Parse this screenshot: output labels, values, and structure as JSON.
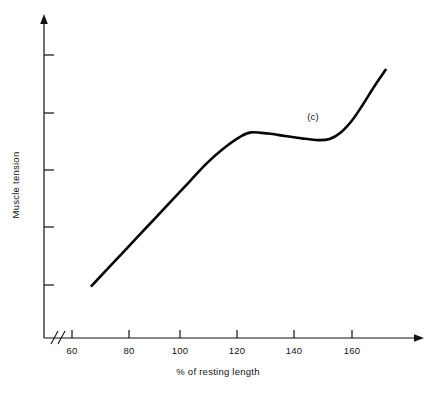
{
  "chart_data": {
    "type": "line",
    "title": "",
    "xlabel": "%  of resting length",
    "ylabel": "Muscle tension",
    "annotations": [
      {
        "text": "(c)",
        "x": 150,
        "y_rel": 0.78
      }
    ],
    "xlim": [
      60,
      172
    ],
    "ylim": [
      0,
      1
    ],
    "grid": false,
    "legend": null,
    "axis_break": "//",
    "xticks": [
      60,
      80,
      100,
      120,
      140,
      160
    ],
    "xtick_labels": [
      "60",
      "80",
      "100",
      "120",
      "140",
      "160"
    ],
    "yticks": [
      0.2,
      0.4,
      0.6,
      0.8,
      1.0
    ],
    "ytick_labels": [
      "",
      "",
      "",
      "",
      ""
    ],
    "series": [
      {
        "name": "muscle tension",
        "x": [
          67,
          72,
          78,
          84,
          90,
          96,
          102,
          108,
          114,
          120,
          124,
          130,
          136,
          142,
          148,
          152,
          156,
          160,
          164,
          168,
          172
        ],
        "y": [
          0.175,
          0.225,
          0.285,
          0.345,
          0.405,
          0.465,
          0.525,
          0.585,
          0.635,
          0.675,
          0.69,
          0.686,
          0.678,
          0.67,
          0.664,
          0.668,
          0.69,
          0.73,
          0.785,
          0.845,
          0.9
        ]
      }
    ]
  },
  "axes": {
    "x_axis_name": "percent-of-resting-length-axis",
    "y_axis_name": "muscle-tension-axis",
    "x_title": "%  of resting length",
    "y_title": "Muscle tension",
    "tick_labels": {
      "t60": "60",
      "t80": "80",
      "t100": "100",
      "t120": "120",
      "t140": "140",
      "t160": "160"
    }
  },
  "annotation": {
    "curve_label": "(c)"
  },
  "style": {
    "curve_color": "#050505",
    "axis_color": "#111111",
    "background": "#ffffff"
  }
}
